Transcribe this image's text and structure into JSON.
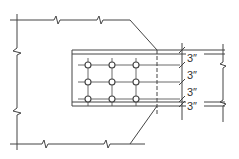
{
  "diagram": {
    "type": "bolted-gusset-plate-connection",
    "colors": {
      "line": "#444444",
      "background": "#ffffff"
    },
    "bolt_grid": {
      "rows": 3,
      "cols": 3
    },
    "dimensions": [
      {
        "label": "3″"
      },
      {
        "label": "3″"
      },
      {
        "label": "3″"
      },
      {
        "label": "3″"
      }
    ]
  }
}
